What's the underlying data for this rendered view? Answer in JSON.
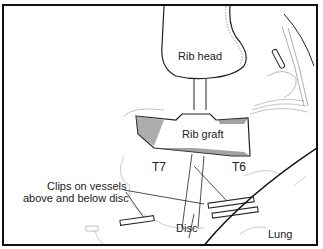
{
  "figure": {
    "type": "surgical-illustration",
    "labels": {
      "rib_head": "Rib head",
      "rib_graft": "Rib graft",
      "t7": "T7",
      "t6": "T6",
      "clips_line1": "Clips on vessels",
      "clips_line2": "above and below disc",
      "disc": "Disc",
      "lung": "Lung"
    },
    "colors": {
      "line": "#222222",
      "hatch": "#555555",
      "tissue": "#9a9a9a",
      "background": "#ffffff"
    }
  }
}
